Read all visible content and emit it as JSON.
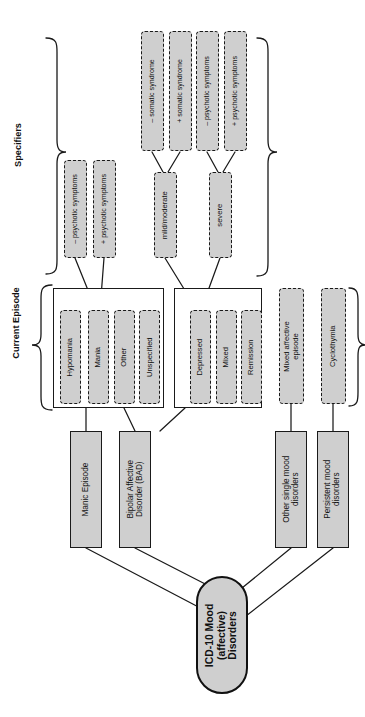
{
  "diagram": {
    "orientation": "rotated-90-ccw",
    "colors": {
      "node_fill": "#cfcfcf",
      "stroke": "#1a1a1a",
      "background": "#ffffff"
    },
    "group_labels": {
      "specifiers": "Specifiers",
      "current_episode": "Current Episode"
    },
    "root": {
      "label": "ICD-10 Mood\n(affective)\nDisorders"
    },
    "disorders": [
      {
        "id": "manic-episode",
        "label": "Manic Episode"
      },
      {
        "id": "bipolar-affective-disorder",
        "label": "Bipolar Affective\nDisorder (BAD)"
      },
      {
        "id": "other-single-mood-disorders",
        "label": "Other single mood\ndisorders"
      },
      {
        "id": "persistent-mood-disorders",
        "label": "Persistent mood\ndisorders"
      }
    ],
    "episode_groups": [
      {
        "id": "manic-group",
        "items": [
          {
            "id": "hypomania",
            "label": "Hypomania"
          },
          {
            "id": "mania",
            "label": "Mania"
          },
          {
            "id": "other",
            "label": "Other"
          },
          {
            "id": "unspecified",
            "label": "Unspecified"
          }
        ]
      },
      {
        "id": "depressive-group",
        "items": [
          {
            "id": "depressed",
            "label": "Depressed"
          },
          {
            "id": "mixed",
            "label": "Mixed"
          },
          {
            "id": "remission",
            "label": "Remission"
          }
        ]
      }
    ],
    "standalone_episodes": [
      {
        "id": "mixed-affective-episode",
        "label": "Mixed affective\nepisode"
      },
      {
        "id": "cyclothymia",
        "label": "Cyclothymia"
      }
    ],
    "specifiers": {
      "mania_severity": [
        {
          "id": "minus-psychotic-symptoms",
          "label": "– psychotic symptoms"
        },
        {
          "id": "plus-psychotic-symptoms",
          "label": "+ psychotic symptoms"
        }
      ],
      "depression_severity": [
        {
          "id": "mild-moderate",
          "label": "mild/moderate"
        },
        {
          "id": "severe",
          "label": "severe"
        }
      ],
      "depression_qualifiers": [
        {
          "id": "minus-somatic-syndrome",
          "label": "– somatic syndrome"
        },
        {
          "id": "plus-somatic-syndrome",
          "label": "+ somatic syndrome"
        },
        {
          "id": "minus-psychotic-symptoms-2",
          "label": "– psychotic symptoms"
        },
        {
          "id": "plus-psychotic-symptoms-2",
          "label": "+ psychotic symptoms"
        }
      ]
    }
  }
}
